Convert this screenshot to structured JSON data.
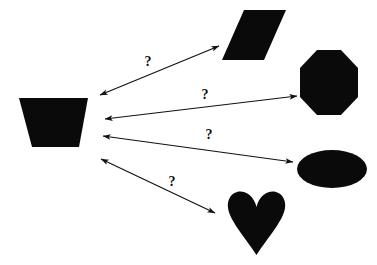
{
  "diagram": {
    "type": "node-link-diagram",
    "width": 377,
    "height": 265,
    "background_color": "#ffffff",
    "shape_color": "#0a0a0a",
    "line_color": "#111111",
    "label_color": "#0d0d0d",
    "source_node": "trapezoid",
    "link_label": "?"
  },
  "shapes": [
    {
      "id": "trapezoid",
      "name": "trapezoid",
      "role": "source",
      "color": "#0a0a0a",
      "bbox": {
        "x": 19,
        "y": 98,
        "width": 69,
        "height": 49
      },
      "points": "19,98 88,98 79,147 32,147"
    },
    {
      "id": "parallelogram",
      "name": "parallelogram",
      "role": "target",
      "color": "#0a0a0a",
      "bbox": {
        "x": 222,
        "y": 10,
        "width": 64,
        "height": 50
      },
      "points": "244,10 286,10 264,60 222,60"
    },
    {
      "id": "octagon",
      "name": "octagon",
      "role": "target",
      "color": "#0a0a0a",
      "bbox": {
        "x": 300,
        "y": 50,
        "width": 58,
        "height": 65
      },
      "points": "317,50 341,50 358,68 358,97 341,115 317,115 300,97 300,68"
    },
    {
      "id": "ellipse",
      "name": "ellipse",
      "role": "target",
      "color": "#0a0a0a",
      "bbox": {
        "x": 297,
        "y": 150,
        "width": 70,
        "height": 38
      },
      "cx": 332,
      "cy": 169,
      "rx": 35,
      "ry": 19
    },
    {
      "id": "heart",
      "name": "heart",
      "role": "target",
      "color": "#0a0a0a",
      "bbox": {
        "x": 228,
        "y": 190,
        "width": 57,
        "height": 65
      },
      "path": "M256.5,207 C259,196 268,190 276,192 C283,194 286,201 285,208 C283,221 269,236 256.5,255 C244,236 230,221 228,208 C227,201 230,194 237,192 C245,190 254,196 256.5,207 Z"
    }
  ],
  "connectors": [
    {
      "id": "link-trapezoid-parallelogram",
      "name": "arrow-trapezoid-to-parallelogram",
      "from": "trapezoid",
      "to": "parallelogram",
      "arrowheads": "both",
      "x1": 100,
      "y1": 95,
      "x2": 219,
      "y2": 46,
      "label": "?",
      "label_x": 148,
      "label_y": 66
    },
    {
      "id": "link-trapezoid-octagon",
      "name": "arrow-trapezoid-to-octagon",
      "from": "trapezoid",
      "to": "octagon",
      "arrowheads": "both",
      "x1": 105,
      "y1": 119,
      "x2": 297,
      "y2": 96,
      "label": "?",
      "label_x": 205,
      "label_y": 99
    },
    {
      "id": "link-trapezoid-ellipse",
      "name": "arrow-trapezoid-to-ellipse",
      "from": "trapezoid",
      "to": "ellipse",
      "arrowheads": "both",
      "x1": 103,
      "y1": 136,
      "x2": 293,
      "y2": 162,
      "label": "?",
      "label_x": 209,
      "label_y": 139
    },
    {
      "id": "link-trapezoid-heart",
      "name": "arrow-trapezoid-to-heart",
      "from": "trapezoid",
      "to": "heart",
      "arrowheads": "both",
      "x1": 101,
      "y1": 159,
      "x2": 215,
      "y2": 213,
      "label": "?",
      "label_x": 172,
      "label_y": 186
    }
  ]
}
